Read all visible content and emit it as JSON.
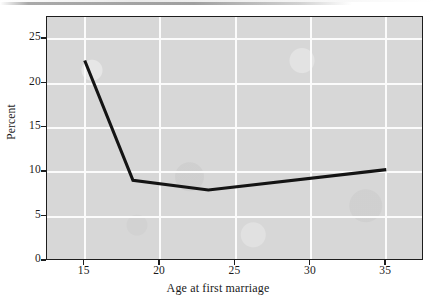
{
  "figure": {
    "kind": "scanned-line-chart",
    "background_color": "#ffffff",
    "plot_background_color": "#d7d7d7",
    "gridline_color": "#fbfbfb",
    "line_color": "#141414",
    "axis_color": "#1d1d1d",
    "text_color": "#1a1a1a"
  },
  "chart_data": {
    "type": "line",
    "title": "",
    "xlabel": "Age at first marriage",
    "ylabel": "Percent",
    "xlim": [
      12.5,
      37.5
    ],
    "ylim": [
      0,
      27.5
    ],
    "xticks": [
      15,
      20,
      25,
      30,
      35
    ],
    "xtick_labels": [
      "15",
      "20",
      "25",
      "30",
      "35"
    ],
    "yticks": [
      0,
      5,
      10,
      15,
      20,
      25
    ],
    "ytick_labels": [
      "0",
      "5",
      "10",
      "15",
      "20",
      "25"
    ],
    "grid": true,
    "grid_axis": "both",
    "legend": false,
    "legend_position": "none",
    "series": [
      {
        "name": "Percent",
        "x": [
          15.0,
          18.2,
          23.2,
          35.0
        ],
        "y": [
          22.6,
          9.1,
          8.0,
          10.3
        ]
      }
    ]
  }
}
